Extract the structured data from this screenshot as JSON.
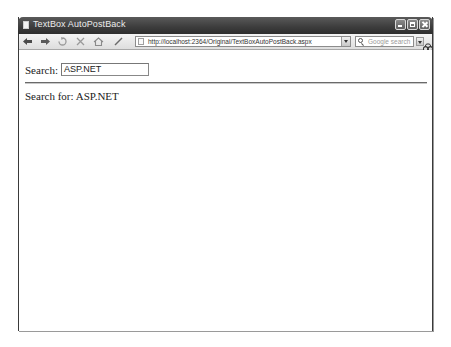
{
  "window": {
    "title": "TextBox AutoPostBack"
  },
  "window_controls": {
    "minimize": "minimize",
    "maximize": "maximize",
    "close": "close"
  },
  "toolbar": {
    "buttons": [
      {
        "name": "back",
        "glyph": "◀"
      },
      {
        "name": "forward",
        "glyph": "▶"
      },
      {
        "name": "stop",
        "glyph": "✕"
      },
      {
        "name": "reload",
        "glyph": "⟳"
      },
      {
        "name": "home",
        "glyph": "⌂"
      },
      {
        "name": "edit",
        "glyph": "/"
      }
    ],
    "address": "http://localhost:2364/Original/TextBoxAutoPostBack.aspx",
    "search_placeholder": "Google search"
  },
  "page": {
    "search_label": "Search:",
    "search_value": "ASP.NET",
    "result_text": "Search for: ASP.NET"
  }
}
